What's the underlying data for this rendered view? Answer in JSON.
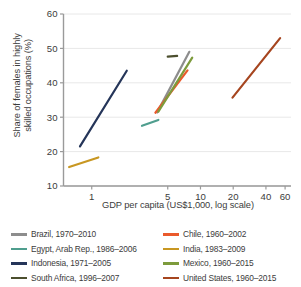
{
  "chart_data": {
    "type": "line",
    "title": "",
    "xlabel": "GDP per capita (US$1,000, log scale)",
    "ylabel": "Share of females in highly\nskilled occupations (%)",
    "xscale": "log",
    "xlim": [
      0.55,
      68
    ],
    "ylim": [
      10,
      60
    ],
    "xticks": [
      1,
      5,
      10,
      20,
      40,
      60
    ],
    "xtick_labels": [
      "1",
      "5",
      "10",
      "20",
      "40",
      "60"
    ],
    "yticks": [
      10,
      20,
      30,
      40,
      50,
      60
    ],
    "ytick_labels": [
      "10",
      "20",
      "30",
      "40",
      "50",
      "60"
    ],
    "grid": "horizontal",
    "legend_position": "bottom",
    "legend_columns": 2,
    "series": [
      {
        "name": "Brazil, 1970–2010",
        "color": "#8d8d8d",
        "x": [
          4.0,
          7.9
        ],
        "y": [
          31.4,
          49.0
        ]
      },
      {
        "name": "Egypt, Arab Rep., 1986–2006",
        "color": "#4f9e8e",
        "x": [
          2.9,
          4.1
        ],
        "y": [
          27.5,
          29.2
        ]
      },
      {
        "name": "Indonesia, 1971–2005",
        "color": "#253559",
        "x": [
          0.78,
          2.1
        ],
        "y": [
          21.5,
          43.5
        ]
      },
      {
        "name": "South Africa, 1996–2007",
        "color": "#4c4f2e",
        "x": [
          5.0,
          6.1
        ],
        "y": [
          47.6,
          47.8
        ]
      },
      {
        "name": "Chile, 1960–2002",
        "color": "#ea5a2c",
        "x": [
          3.85,
          7.6
        ],
        "y": [
          31.3,
          43.6
        ]
      },
      {
        "name": "India, 1983–2009",
        "color": "#c89722",
        "x": [
          0.62,
          1.15
        ],
        "y": [
          15.5,
          18.3
        ]
      },
      {
        "name": "Mexico, 1960–2015",
        "color": "#7d9b3c",
        "x": [
          4.1,
          8.4
        ],
        "y": [
          31.6,
          47.3
        ]
      },
      {
        "name": "United States, 1960–2015",
        "color": "#a6451f",
        "x": [
          19.7,
          54.0
        ],
        "y": [
          35.7,
          53.0
        ]
      }
    ]
  },
  "axis": {
    "y_title": "Share of females in highly\nskilled occupations (%)",
    "x_title": "GDP per capita (US$1,000, log scale)"
  },
  "legend": {
    "rows": [
      {
        "left": {
          "label": "Brazil, 1970–2010",
          "color": "#8d8d8d"
        },
        "right": {
          "label": "Chile, 1960–2002",
          "color": "#ea5a2c"
        }
      },
      {
        "left": {
          "label": "Egypt, Arab Rep., 1986–2006",
          "color": "#4f9e8e"
        },
        "right": {
          "label": "India, 1983–2009",
          "color": "#c89722"
        }
      },
      {
        "left": {
          "label": "Indonesia, 1971–2005",
          "color": "#253559"
        },
        "right": {
          "label": "Mexico, 1960–2015",
          "color": "#7d9b3c"
        }
      },
      {
        "left": {
          "label": "South Africa, 1996–2007",
          "color": "#4c4f2e"
        },
        "right": {
          "label": "United States, 1960–2015",
          "color": "#a6451f"
        }
      }
    ]
  },
  "style": {
    "background": "#ffffff",
    "text_color": "#3c3c3c",
    "grid_color": "#e8e8e8",
    "axis_color": "#9a9a9a"
  }
}
